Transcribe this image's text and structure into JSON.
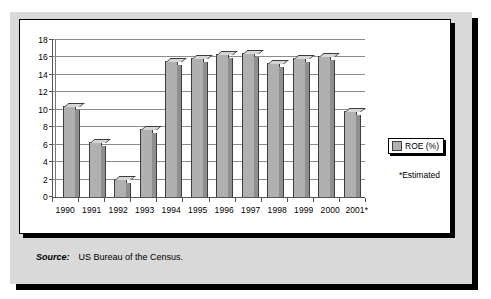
{
  "chart_data": {
    "type": "bar",
    "title": "",
    "subtitle": "",
    "xlabel": "",
    "ylabel": "",
    "categories": [
      "1990",
      "1991",
      "1992",
      "1993",
      "1994",
      "1995",
      "1996",
      "1997",
      "1998",
      "1999",
      "2000",
      "2001*"
    ],
    "series": [
      {
        "name": "ROE (%)",
        "values": [
          10.4,
          6.3,
          2.1,
          7.8,
          15.6,
          15.9,
          16.4,
          16.5,
          15.4,
          15.9,
          16.2,
          9.9
        ],
        "color": "#b0b0b0"
      }
    ],
    "ylim": [
      0,
      18
    ],
    "ytick_step": 2,
    "ytick_labels": [
      "0",
      "2",
      "4",
      "6",
      "8",
      "10",
      "12",
      "14",
      "16",
      "18"
    ],
    "grid": true,
    "grid_axis": "y",
    "legend_position": "right",
    "annotations": [
      "*Estimated"
    ]
  },
  "legend": {
    "entry_label": "ROE (%)",
    "swatch_color": "#b0b0b0"
  },
  "notes": {
    "estimated": "*Estimated"
  },
  "footer": {
    "source_label": "Source:",
    "source_text": "US Bureau of the Census."
  },
  "colors": {
    "panel_background": "#d9d9d9",
    "card_background": "#ffffff",
    "bar_face": "#b0b0b0",
    "bar_side": "#8f8f8f",
    "bar_top": "#d5d5d5",
    "bar_outline": "#3d3d3d",
    "gridline": "#8c8c8c",
    "axis": "#555555",
    "shadow": "#000000"
  }
}
